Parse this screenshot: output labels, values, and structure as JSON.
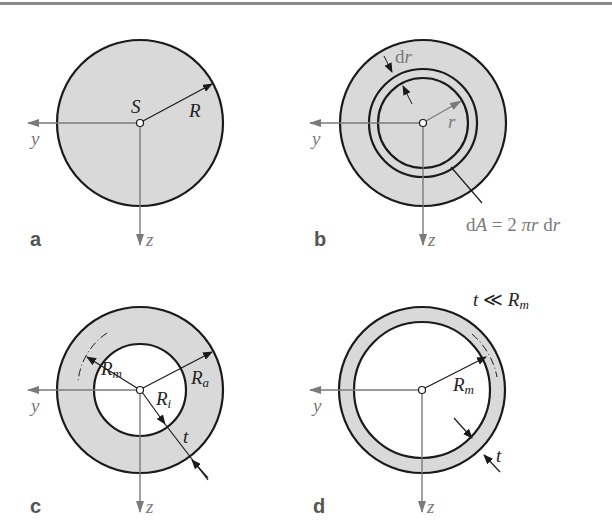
{
  "figure": {
    "colors": {
      "fill": "#d9d9d9",
      "outline": "#1a1a1a",
      "axis": "#7a7a7a",
      "panel_label": "#555555",
      "top_rule": "#8a8a8a"
    },
    "panels": [
      {
        "id": "a",
        "label": "a",
        "description": "Solid circular cross-section",
        "centroid_label": "S",
        "radius_label": "R",
        "axes": {
          "y": "y",
          "z": "z"
        }
      },
      {
        "id": "b",
        "label": "b",
        "description": "Differential ring element",
        "thickness_label": "dr",
        "thickness_d": "d",
        "thickness_r": "r",
        "radius_label": "r",
        "area_equation": "dA = 2 πr dr",
        "eq_parts": {
          "d1": "d",
          "A": "A",
          "eq": " = 2 ",
          "pi": "π",
          "r1": "r",
          "sp": " ",
          "d2": "d",
          "r2": "r"
        },
        "axes": {
          "y": "y",
          "z": "z"
        }
      },
      {
        "id": "c",
        "label": "c",
        "description": "Thick-walled annulus",
        "labels": {
          "Rm": {
            "base": "R",
            "sub": "m"
          },
          "Ra": {
            "base": "R",
            "sub": "a"
          },
          "Ri": {
            "base": "R",
            "sub": "i"
          },
          "t": "t"
        },
        "axes": {
          "y": "y",
          "z": "z"
        }
      },
      {
        "id": "d",
        "label": "d",
        "description": "Thin-walled ring",
        "condition": {
          "t": "t",
          "op": " ≪ ",
          "R": "R",
          "sub": "m"
        },
        "labels": {
          "Rm": {
            "base": "R",
            "sub": "m"
          },
          "t": "t"
        },
        "axes": {
          "y": "y",
          "z": "z"
        }
      }
    ]
  }
}
